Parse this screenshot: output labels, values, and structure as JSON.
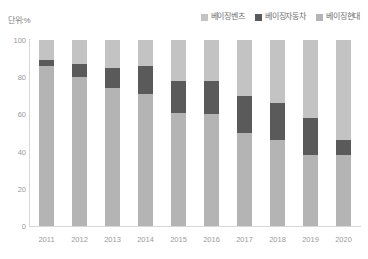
{
  "unit_label": "단위:%",
  "legend": {
    "position": "top-right",
    "items": [
      {
        "label": "베이징벤츠",
        "color": "#c3c3c3",
        "swatch_name": "legend-swatch-benz"
      },
      {
        "label": "베이징자동차",
        "color": "#5a5a5a",
        "swatch_name": "legend-swatch-automotive"
      },
      {
        "label": "베이징현대",
        "color": "#b4b4b4",
        "swatch_name": "legend-swatch-hyundai"
      }
    ]
  },
  "chart_data": {
    "type": "bar",
    "stacked": true,
    "title": "",
    "xlabel": "",
    "ylabel": "",
    "unit": "%",
    "ylim": [
      0,
      100
    ],
    "yticks": [
      100,
      80,
      60,
      40,
      20,
      0
    ],
    "grid": false,
    "categories": [
      "2011",
      "2012",
      "2013",
      "2014",
      "2015",
      "2016",
      "2017",
      "2018",
      "2019",
      "2020"
    ],
    "series": [
      {
        "name": "베이징현대",
        "color": "#b4b4b4",
        "values": [
          86,
          80,
          74,
          71,
          61,
          60,
          50,
          46,
          38,
          38
        ]
      },
      {
        "name": "베이징자동차",
        "color": "#5a5a5a",
        "values": [
          3,
          7,
          11,
          15,
          17,
          18,
          20,
          20,
          20,
          8
        ]
      },
      {
        "name": "베이징벤츠",
        "color": "#c3c3c3",
        "values": [
          11,
          13,
          15,
          14,
          22,
          22,
          30,
          34,
          42,
          54
        ]
      }
    ]
  },
  "colors": {
    "axis": "#d8d8d8",
    "tick_text": "#9a9a9a",
    "legend_text": "#6f6f6f",
    "background": "#ffffff"
  }
}
